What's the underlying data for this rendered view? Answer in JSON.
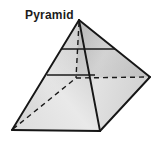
{
  "figure": {
    "label": "Pyramid",
    "label_position": {
      "x": 25,
      "y": 9
    },
    "background_color": "#ffffff",
    "stroke_color": "#1a1a1a",
    "hidden_edge_style": "dashed",
    "canvas": {
      "width": 162,
      "height": 161
    }
  },
  "geometry": {
    "description": "Square-based pyramid drawn in oblique projection with hidden back edges dashed and two horizontal cross-section lines.",
    "vertices": {
      "apex": {
        "name": "apex",
        "x": 79,
        "y": 20
      },
      "front_left": {
        "name": "front-left-base-vertex",
        "x": 12,
        "y": 130
      },
      "front_bottom": {
        "name": "front-bottom-base-vertex",
        "x": 100,
        "y": 131
      },
      "right": {
        "name": "right-base-vertex",
        "x": 150,
        "y": 77
      },
      "back_hidden": {
        "name": "back-hidden-base-vertex",
        "x": 76,
        "y": 78
      }
    },
    "solid_edges": [
      {
        "name": "apex-to-front-left",
        "from": "apex",
        "to": "front_left"
      },
      {
        "name": "apex-to-front-bottom",
        "from": "apex",
        "to": "front_bottom"
      },
      {
        "name": "apex-to-right",
        "from": "apex",
        "to": "right"
      },
      {
        "name": "base-front-left-to-front-bottom",
        "from": "front_left",
        "to": "front_bottom"
      },
      {
        "name": "base-front-bottom-to-right",
        "from": "front_bottom",
        "to": "right"
      }
    ],
    "hidden_edges": [
      {
        "name": "apex-to-back-hidden",
        "from": "apex",
        "to": "back_hidden"
      },
      {
        "name": "base-front-left-to-back-hidden",
        "from": "front_left",
        "to": "back_hidden"
      },
      {
        "name": "base-back-hidden-to-right",
        "from": "back_hidden",
        "to": "right"
      }
    ],
    "cross_sections": [
      {
        "name": "upper-cross-section",
        "x1": 62,
        "y1": 49,
        "x2": 115,
        "y2": 49
      },
      {
        "name": "lower-cross-section",
        "x1": 47,
        "y1": 75,
        "x2": 95,
        "y2": 75
      }
    ]
  },
  "faces": {
    "left_front": {
      "name": "left-front-face",
      "fill_light": "#e8e8e8",
      "fill_dark": "#b8b8b8"
    },
    "right_front": {
      "name": "right-front-face",
      "fill_light": "#e4e4e4",
      "fill_dark": "#bdbdbd"
    },
    "upper_right": {
      "name": "upper-right-face",
      "fill_light": "#cfcfcf",
      "fill_dark": "#9c9c9c"
    },
    "upper_left": {
      "name": "upper-left-face",
      "fill_light": "#dedede",
      "fill_dark": "#b0b0b0"
    }
  },
  "colors": {
    "outline": "#1a1a1a",
    "background": "#ffffff",
    "label_text": "#1c1c1c",
    "border_tint": "#d9d9d9"
  }
}
